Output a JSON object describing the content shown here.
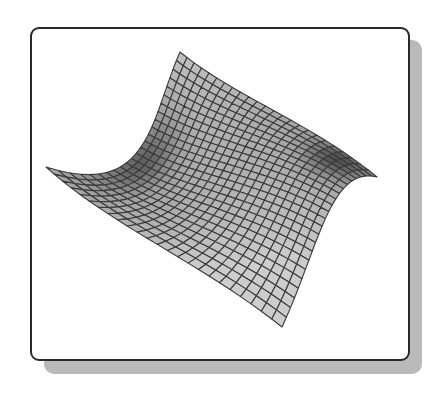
{
  "figure": {
    "frame_color": "#2a2a2a",
    "shadow_color": "#c8c8c8",
    "surface_fill": "#bdbdbd",
    "mesh_line_color": "#3a3a3a"
  },
  "chart_data": {
    "type": "surface",
    "title": "",
    "xlabel": "",
    "ylabel": "",
    "zlabel": "",
    "grid_on": false,
    "legend": null,
    "mesh": {
      "rows": 24,
      "cols": 24
    },
    "surface_shape": "saddle-like curved sheet with a raised peak at the back, a curled right wing, a lifted left wing, and a lower front tip",
    "outline_points_px": {
      "peak_top": [
        180,
        52
      ],
      "right_tip": [
        377,
        177
      ],
      "bottom_tip": [
        282,
        327
      ],
      "left_tip": [
        46,
        167
      ]
    },
    "boundary_curves_px": {
      "top_edge": [
        [
          180,
          52
        ],
        [
          235,
          97
        ],
        [
          310,
          122
        ],
        [
          377,
          177
        ]
      ],
      "right_edge": [
        [
          377,
          177
        ],
        [
          330,
          165
        ],
        [
          318,
          250
        ],
        [
          282,
          327
        ]
      ],
      "bottom_edge": [
        [
          46,
          167
        ],
        [
          110,
          225
        ],
        [
          200,
          262
        ],
        [
          282,
          327
        ]
      ],
      "left_edge": [
        [
          180,
          52
        ],
        [
          150,
          120
        ],
        [
          150,
          200
        ],
        [
          46,
          167
        ]
      ]
    }
  }
}
